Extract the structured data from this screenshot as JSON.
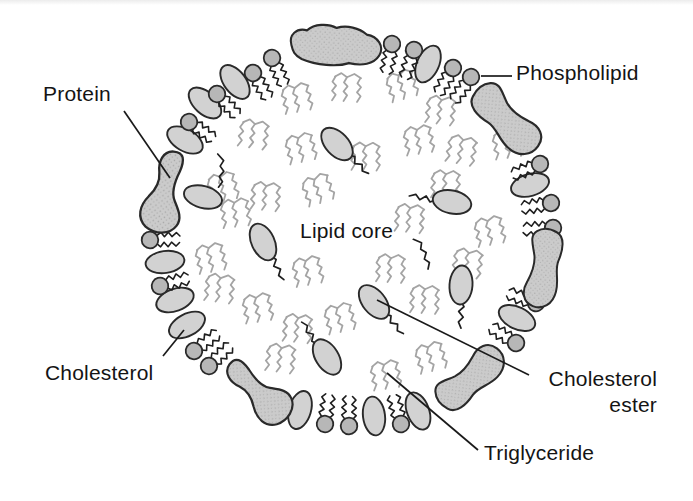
{
  "figure": {
    "background": "#ffffff",
    "palette": {
      "outline": "#2b2b2b",
      "protein_fill": "#cbcbcb",
      "protein_dot": "#a8a8a8",
      "phospholipid_head_fill": "#b7b7b7",
      "cholesterol_fill": "#d2d2d2",
      "triglyceride_stroke": "#a4a4a4",
      "tail_stroke": "#1e1e1e",
      "label_color": "#141414",
      "leader_stroke": "#1a1a1a"
    },
    "labels": {
      "protein": {
        "text": "Protein",
        "x": 43,
        "y": 81,
        "leader": [
          124,
          111,
          170,
          178
        ]
      },
      "phospholipid": {
        "text": "Phospholipid",
        "x": 516,
        "y": 60,
        "leader": [
          481,
          76,
          512,
          76
        ]
      },
      "lipid_core": {
        "text": "Lipid core",
        "x": 300,
        "y": 218
      },
      "cholesterol": {
        "text": "Cholesterol",
        "x": 45,
        "y": 360,
        "leader": [
          184,
          330,
          163,
          356
        ]
      },
      "cholesterol_ester": {
        "line1": "Cholesterol",
        "line2": "ester",
        "x": 533,
        "y": 366,
        "width": 124,
        "leader": [
          377,
          300,
          529,
          375
        ]
      },
      "triglyceride": {
        "text": "Triglyceride",
        "x": 484,
        "y": 440,
        "leader": [
          387,
          373,
          478,
          450
        ]
      }
    },
    "membrane": {
      "proteins": [
        {
          "variant": "bumpy",
          "x": 337,
          "y": 47,
          "rot": 5,
          "sx": 0.95,
          "sy": 1
        },
        {
          "variant": "bean",
          "x": 507,
          "y": 120,
          "rot": -40,
          "sx": 1,
          "sy": 1
        },
        {
          "variant": "bean",
          "x": 543,
          "y": 269,
          "rot": 6,
          "sx": -0.9,
          "sy": 0.95
        },
        {
          "variant": "bean",
          "x": 471,
          "y": 377,
          "rot": -128,
          "sx": 0.95,
          "sy": 0.95
        },
        {
          "variant": "kidney",
          "x": 258,
          "y": 388,
          "rot": -49,
          "sx": 1,
          "sy": 1
        },
        {
          "variant": "kidney",
          "x": 168,
          "y": 190,
          "rot": 10,
          "sx": 1.05,
          "sy": 1.05
        }
      ],
      "cholesterol": [
        [
          428,
          64,
          24
        ],
        [
          235,
          82,
          -37
        ],
        [
          205,
          103,
          -48
        ],
        [
          185,
          140,
          -60
        ],
        [
          203,
          197,
          -75
        ],
        [
          165,
          262,
          -98
        ],
        [
          175,
          300,
          -110
        ],
        [
          187,
          325,
          -118
        ],
        [
          300,
          410,
          -164
        ],
        [
          374,
          416,
          173
        ],
        [
          418,
          411,
          159
        ],
        [
          517,
          318,
          116
        ],
        [
          530,
          185,
          74
        ]
      ],
      "phospholipids": [
        [
          272,
          58,
          -24
        ],
        [
          253,
          73,
          -31
        ],
        [
          217,
          94,
          -43
        ],
        [
          189,
          122,
          -55
        ],
        [
          150,
          240,
          -91
        ],
        [
          160,
          286,
          -105
        ],
        [
          194,
          351,
          -126
        ],
        [
          209,
          366,
          -133
        ],
        [
          325,
          424,
          -172
        ],
        [
          349,
          426,
          -179
        ],
        [
          401,
          424,
          165
        ],
        [
          516,
          343,
          123
        ],
        [
          536,
          303,
          110
        ],
        [
          553,
          228,
          88
        ],
        [
          551,
          203,
          81
        ],
        [
          540,
          164,
          69
        ],
        [
          471,
          77,
          37
        ],
        [
          453,
          68,
          31
        ],
        [
          392,
          44,
          12
        ],
        [
          414,
          50,
          19
        ]
      ]
    },
    "core": {
      "triglycerides": [
        [
          299,
          97,
          -8
        ],
        [
          349,
          87,
          6
        ],
        [
          404,
          84,
          -14
        ],
        [
          443,
          110,
          10
        ],
        [
          256,
          134,
          12
        ],
        [
          303,
          147,
          -10
        ],
        [
          368,
          156,
          4
        ],
        [
          421,
          139,
          -6
        ],
        [
          464,
          150,
          14
        ],
        [
          225,
          186,
          -10
        ],
        [
          268,
          196,
          8
        ],
        [
          320,
          188,
          -16
        ],
        [
          448,
          184,
          6
        ],
        [
          492,
          230,
          -8
        ],
        [
          470,
          263,
          12
        ],
        [
          238,
          212,
          -4
        ],
        [
          213,
          257,
          -8
        ],
        [
          222,
          288,
          10
        ],
        [
          260,
          307,
          -6
        ],
        [
          300,
          328,
          8
        ],
        [
          342,
          317,
          -10
        ],
        [
          427,
          299,
          6
        ],
        [
          433,
          356,
          -12
        ],
        [
          283,
          358,
          10
        ],
        [
          388,
          374,
          -6
        ],
        [
          412,
          218,
          8
        ],
        [
          510,
          143,
          -6
        ],
        [
          310,
          270,
          -8
        ],
        [
          393,
          268,
          6
        ]
      ],
      "cholesterol_esters": [
        [
          374,
          302,
          -39
        ],
        [
          337,
          144,
          -43
        ],
        [
          452,
          202,
          102
        ],
        [
          461,
          285,
          4
        ],
        [
          327,
          357,
          148
        ],
        [
          263,
          242,
          -25
        ]
      ],
      "free_tails": [
        [
          222,
          170,
          10
        ],
        [
          424,
          252,
          -15
        ]
      ]
    }
  }
}
